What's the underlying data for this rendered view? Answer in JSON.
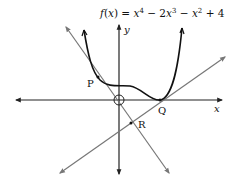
{
  "equation": {
    "lhs": "f(x)",
    "eq": "=",
    "terms": [
      "x",
      "4",
      "− 2x",
      "3",
      "− x",
      "2",
      "+ 4"
    ]
  },
  "axes": {
    "x_label": "x",
    "y_label": "y",
    "origin_label": "O"
  },
  "points": {
    "P": "P",
    "Q": "Q",
    "R": "R"
  },
  "colors": {
    "curve": "#111111",
    "axes": "#222222",
    "lines": "#777777"
  }
}
